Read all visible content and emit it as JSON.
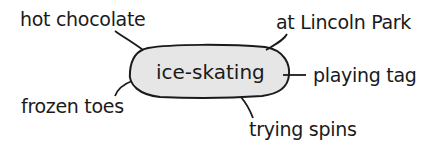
{
  "diagram": {
    "type": "word web",
    "center": {
      "label": "ice-skating",
      "fill": "#e6e6e6",
      "stroke": "#1a1a1a"
    },
    "nodes": [
      {
        "label": "hot chocolate"
      },
      {
        "label": "at Lincoln Park"
      },
      {
        "label": "playing tag"
      },
      {
        "label": "frozen toes"
      },
      {
        "label": "trying spins"
      }
    ]
  }
}
